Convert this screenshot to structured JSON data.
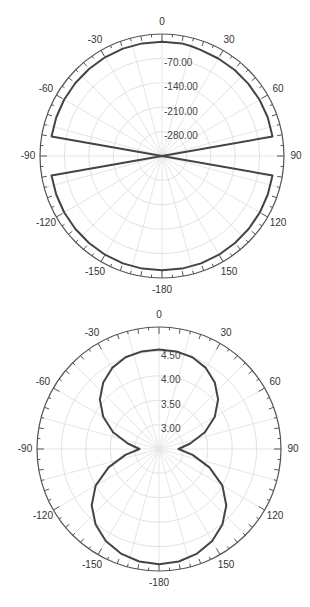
{
  "chart_data": [
    {
      "type": "polar-line",
      "title": "",
      "angle_unit": "degrees",
      "angle_zero": "top",
      "angle_direction": "clockwise",
      "angular_tick_labels": [
        "0",
        "30",
        "60",
        "90",
        "120",
        "150",
        "-180",
        "-150",
        "-120",
        "-90",
        "-60",
        "-30"
      ],
      "angular_tick_angles": [
        0,
        30,
        60,
        90,
        120,
        150,
        180,
        -150,
        -120,
        -90,
        -60,
        -30
      ],
      "radial_range": [
        -350,
        0
      ],
      "radial_tick_labels": [
        "-70.00",
        "-140.00",
        "-210.00",
        "-280.00"
      ],
      "radial_ticks": [
        -70,
        -140,
        -210,
        -280
      ],
      "grid": true,
      "series": [
        {
          "name": "pattern",
          "angles": [
            -180,
            -170,
            -160,
            -150,
            -140,
            -130,
            -120,
            -110,
            -100,
            -95,
            -90,
            -85,
            -80,
            -70,
            -60,
            -50,
            -40,
            -30,
            -20,
            -10,
            0,
            10,
            15,
            20,
            30,
            40,
            50,
            60,
            70,
            80,
            85,
            90,
            95,
            100,
            110,
            120,
            130,
            140,
            150,
            160,
            170,
            180
          ],
          "values": [
            -22,
            -22,
            -22,
            -23,
            -24,
            -25,
            -26,
            -27,
            -28,
            -350,
            -350,
            -350,
            -28,
            -27,
            -26,
            -25,
            -24,
            -23,
            -22,
            -22,
            -22,
            -22,
            -24,
            -26,
            -27,
            -27,
            -27,
            -27,
            -27,
            -28,
            -350,
            -350,
            -350,
            -28,
            -27,
            -26,
            -25,
            -24,
            -23,
            -22,
            -22,
            -22
          ]
        }
      ]
    },
    {
      "type": "polar-line",
      "title": "",
      "angle_unit": "degrees",
      "angle_zero": "top",
      "angle_direction": "clockwise",
      "angular_tick_labels": [
        "0",
        "30",
        "60",
        "90",
        "120",
        "150",
        "-180",
        "-150",
        "-120",
        "-90",
        "-60",
        "-30"
      ],
      "angular_tick_angles": [
        0,
        30,
        60,
        90,
        120,
        150,
        180,
        -150,
        -120,
        -90,
        -60,
        -30
      ],
      "radial_range": [
        2.5,
        5.0
      ],
      "radial_tick_labels": [
        "4.50",
        "4.00",
        "3.50",
        "3.00"
      ],
      "radial_ticks": [
        4.5,
        4.0,
        3.5,
        3.0
      ],
      "grid": true,
      "series": [
        {
          "name": "pattern",
          "angles": [
            -180,
            -170,
            -160,
            -150,
            -140,
            -130,
            -120,
            -110,
            -100,
            -90,
            -80,
            -70,
            -60,
            -50,
            -40,
            -30,
            -20,
            -10,
            0,
            10,
            20,
            30,
            40,
            50,
            60,
            70,
            80,
            90,
            100,
            110,
            120,
            130,
            140,
            150,
            160,
            170,
            180
          ],
          "values": [
            4.86,
            4.84,
            4.78,
            4.68,
            4.52,
            4.3,
            4.0,
            3.6,
            3.2,
            2.9,
            3.15,
            3.5,
            3.82,
            4.08,
            4.28,
            4.42,
            4.5,
            4.53,
            4.54,
            4.53,
            4.5,
            4.42,
            4.28,
            4.08,
            3.82,
            3.5,
            3.15,
            2.9,
            3.2,
            3.6,
            4.0,
            4.3,
            4.52,
            4.68,
            4.78,
            4.84,
            4.86
          ]
        }
      ]
    }
  ],
  "charts": {
    "top": {
      "center": [
        162,
        156
      ],
      "radius": 122
    },
    "bottom": {
      "center": [
        159,
        149
      ],
      "radius": 122
    }
  }
}
